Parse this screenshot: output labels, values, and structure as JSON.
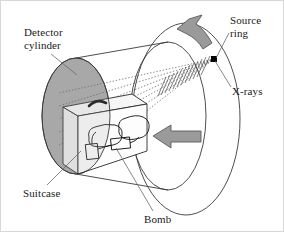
{
  "figure": {
    "background": "#ffffff",
    "border_color": "#d8d8d8"
  },
  "labels": {
    "detector_cylinder_line1": "Detector",
    "detector_cylinder_line2": "cylinder",
    "source_ring_line1": "Source",
    "source_ring_line2": "ring",
    "xrays": "X-rays",
    "suitcase": "Suitcase",
    "bomb": "Bomb"
  },
  "colors": {
    "stroke": "#333333",
    "detector_face_fill": "#a9a9a9",
    "arrow_fill": "#9a9a9a",
    "arrow_stroke": "#5a5a5a",
    "suitcase_fill": "#fdfdfd",
    "suitcase_side_fill": "#ececec",
    "ray_color": "#555555",
    "leader_color": "#666666",
    "source_dot": "#000000",
    "text": "#1a1a1a"
  },
  "geometry": {
    "source_point": {
      "x": 213,
      "y": 58
    },
    "detector_disk": {
      "cx": 75,
      "cy": 115,
      "rx": 34,
      "ry": 58
    },
    "source_ring": {
      "cx": 185,
      "cy": 118,
      "rx": 54,
      "ry": 96
    },
    "inner_rim": {
      "cx": 167,
      "cy": 115,
      "rx": 38,
      "ry": 74
    },
    "ray_count": 7,
    "straight_arrow": {
      "x": 176,
      "y": 135,
      "direction": "left"
    },
    "curved_arrow": {
      "x": 200,
      "y": 28,
      "direction": "rotate-counterclockwise"
    }
  },
  "annotations": {
    "detector_cylinder_leader": "from label down-right to detector disk edge",
    "source_ring_leader": "from label down-left to source dot on ring",
    "xrays_leader": "from label up-left to ring outline",
    "suitcase_leader": "from label up-right to suitcase body",
    "bomb_leader": "from label up-left to bomb inside suitcase"
  }
}
